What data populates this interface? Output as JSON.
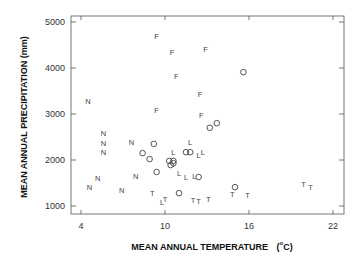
{
  "chart_data": {
    "type": "scatter",
    "title": "",
    "xlabel": "MEAN ANNUAL TEMPERATURE",
    "xlabel_unit_prefix": "(",
    "xlabel_unit_super": "o",
    "xlabel_unit_suffix": "C)",
    "ylabel": "MEAN ANNUAL PRECIPITATION (mm)",
    "xlim": [
      3.3,
      22.8
    ],
    "ylim": [
      830,
      5180
    ],
    "xticks": [
      4,
      10,
      16,
      22
    ],
    "yticks": [
      1000,
      2000,
      3000,
      4000,
      5000
    ],
    "grid": false,
    "legend": "none (point markers are letter symbols)",
    "series": [
      {
        "name": "N",
        "marker": "N",
        "points": [
          [
            4.5,
            3280
          ],
          [
            5.6,
            2570
          ],
          [
            5.6,
            2370
          ],
          [
            5.6,
            2170
          ],
          [
            7.6,
            2390
          ],
          [
            5.2,
            1610
          ],
          [
            4.6,
            1410
          ],
          [
            6.9,
            1350
          ],
          [
            7.9,
            1650
          ]
        ]
      },
      {
        "name": "F",
        "marker": "F",
        "points": [
          [
            9.4,
            4700
          ],
          [
            10.5,
            4350
          ],
          [
            12.9,
            4410
          ],
          [
            10.8,
            3830
          ],
          [
            12.5,
            3430
          ],
          [
            9.4,
            3070
          ],
          [
            12.6,
            2980
          ]
        ]
      },
      {
        "name": "O",
        "marker": "circle",
        "points": [
          [
            15.6,
            3910
          ],
          [
            13.2,
            2700
          ],
          [
            13.7,
            2800
          ],
          [
            9.2,
            2350
          ],
          [
            8.4,
            2150
          ],
          [
            8.9,
            2020
          ],
          [
            9.4,
            1740
          ],
          [
            10.3,
            1980
          ],
          [
            10.4,
            1890
          ],
          [
            10.6,
            1930
          ],
          [
            10.6,
            1980
          ],
          [
            11.5,
            2170
          ],
          [
            11.8,
            2170
          ],
          [
            11.0,
            1280
          ],
          [
            12.4,
            1630
          ],
          [
            15.0,
            1410
          ]
        ]
      },
      {
        "name": "L",
        "marker": "L",
        "points": [
          [
            10.6,
            2170
          ],
          [
            11.8,
            2390
          ],
          [
            12.4,
            2110
          ],
          [
            12.7,
            2170
          ],
          [
            11.0,
            1720
          ],
          [
            11.5,
            1630
          ],
          [
            12.1,
            1650
          ],
          [
            9.8,
            1090
          ]
        ]
      },
      {
        "name": "T",
        "marker": "T",
        "points": [
          [
            9.1,
            1280
          ],
          [
            10.0,
            1150
          ],
          [
            12.0,
            1130
          ],
          [
            12.4,
            1110
          ],
          [
            13.1,
            1150
          ],
          [
            14.8,
            1260
          ],
          [
            15.9,
            1240
          ],
          [
            19.9,
            1480
          ],
          [
            20.4,
            1410
          ]
        ]
      }
    ]
  },
  "layout": {
    "plot_left": 71,
    "plot_right": 344,
    "plot_top": 16,
    "plot_bottom": 214,
    "x_px_at_4": 81,
    "x_px_per_unit": 14,
    "y_px_at_1000": 206,
    "y_px_per_1000": 46
  }
}
